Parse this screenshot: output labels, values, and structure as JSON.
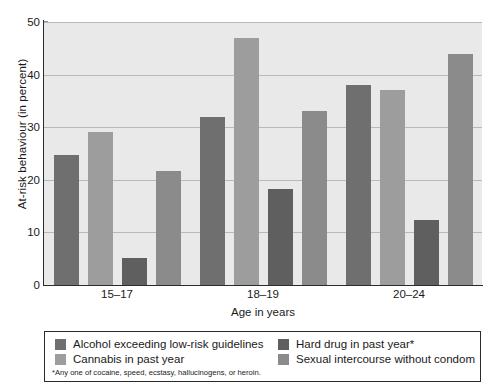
{
  "chart_data": {
    "type": "bar",
    "title": "",
    "xlabel": "Age in years",
    "ylabel": "At-risk behaviour (in percent)",
    "categories": [
      "15–17",
      "18–19",
      "20–24"
    ],
    "ylim": [
      0,
      50
    ],
    "yticks": [
      0,
      10,
      20,
      30,
      40,
      50
    ],
    "grid": true,
    "legend_position": "bottom",
    "series": [
      {
        "name": "Alcohol exceeding low-risk guidelines",
        "color": "#6f6f6f",
        "values": [
          24.7,
          32.0,
          38.0
        ]
      },
      {
        "name": "Cannabis in past year",
        "color": "#9d9d9d",
        "values": [
          29.0,
          47.0,
          37.0
        ]
      },
      {
        "name": "Hard drug in past year*",
        "color": "#5f5f5f",
        "values": [
          5.2,
          18.2,
          12.4
        ]
      },
      {
        "name": "Sexual intercourse without condom",
        "color": "#8b8b8b",
        "values": [
          21.7,
          33.0,
          44.0
        ]
      }
    ],
    "annotations": [
      "*Any one of cocaine, speed, ecstasy, hallucinogens, or heroin."
    ]
  },
  "axis": {
    "ylabel": "At-risk behaviour (in percent)",
    "xlabel": "Age in years",
    "ytick_labels": [
      "0",
      "10",
      "20",
      "30",
      "40",
      "50"
    ],
    "xtick_labels": [
      "15–17",
      "18–19",
      "20–24"
    ]
  },
  "legend": {
    "items": [
      {
        "label": "Alcohol exceeding low-risk guidelines",
        "color": "#6f6f6f"
      },
      {
        "label": "Cannabis in past year",
        "color": "#9d9d9d"
      },
      {
        "label": "Hard drug in past year*",
        "color": "#5f5f5f"
      },
      {
        "label": "Sexual intercourse without condom",
        "color": "#8b8b8b"
      }
    ],
    "footnote": "*Any one of cocaine, speed, ecstasy, hallucinogens, or heroin."
  },
  "style": {
    "plot_background": "#e9e9e9",
    "gridline_color": "#b9b9b9",
    "axis_color": "#2b2b2b"
  }
}
